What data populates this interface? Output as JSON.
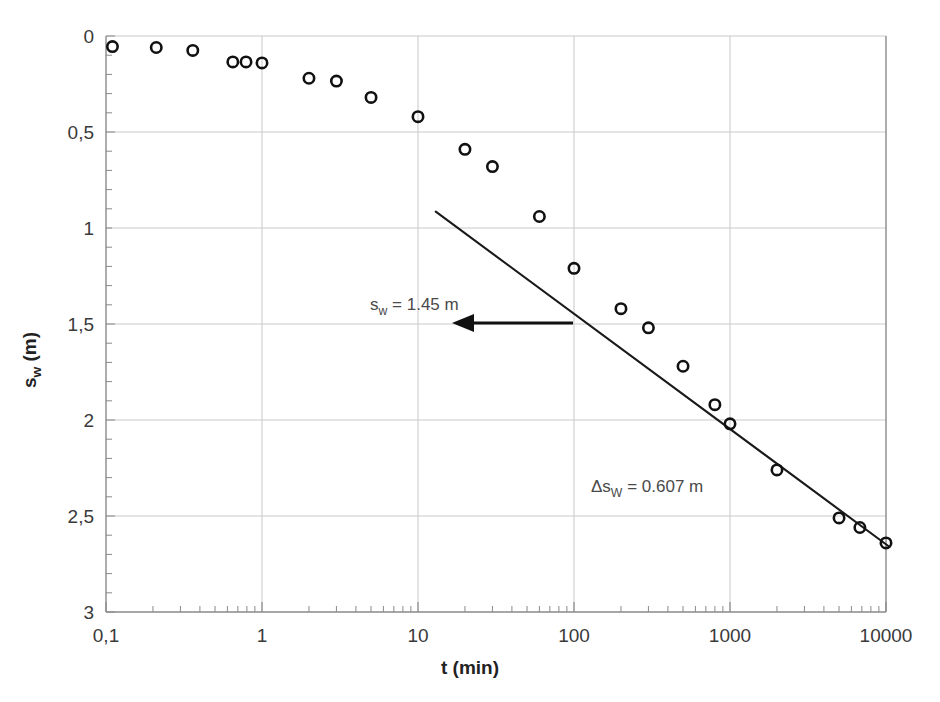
{
  "chart_data": {
    "type": "scatter",
    "title": "",
    "xlabel": "t (min)",
    "ylabel": "s_w (m)",
    "ylabel_base": "s",
    "ylabel_sub": "w",
    "ylabel_unit": " (m)",
    "xscale": "log",
    "yscale": "linear",
    "xlim": [
      0.1,
      10000
    ],
    "ylim": [
      0,
      3
    ],
    "y_inverted": true,
    "grid": true,
    "legend": "none",
    "x_tick_labels": [
      "0,1",
      "1",
      "10",
      "100",
      "1000",
      "10000"
    ],
    "x_tick_values": [
      0.1,
      1,
      10,
      100,
      1000,
      10000
    ],
    "y_tick_labels": [
      "0",
      "0,5",
      "1",
      "1,5",
      "2",
      "2,5",
      "3"
    ],
    "y_tick_values": [
      0,
      0.5,
      1,
      1.5,
      2,
      2.5,
      3
    ],
    "series": [
      {
        "name": "drawdown-observations",
        "marker": "open-circle",
        "points": [
          {
            "t": 0.11,
            "s": 0.055
          },
          {
            "t": 0.21,
            "s": 0.06
          },
          {
            "t": 0.36,
            "s": 0.075
          },
          {
            "t": 0.65,
            "s": 0.135
          },
          {
            "t": 0.79,
            "s": 0.135
          },
          {
            "t": 1.0,
            "s": 0.14
          },
          {
            "t": 2.0,
            "s": 0.22
          },
          {
            "t": 3.0,
            "s": 0.235
          },
          {
            "t": 5.0,
            "s": 0.32
          },
          {
            "t": 10.0,
            "s": 0.42
          },
          {
            "t": 20.0,
            "s": 0.59
          },
          {
            "t": 30.0,
            "s": 0.68
          },
          {
            "t": 60.0,
            "s": 0.94
          },
          {
            "t": 100.0,
            "s": 1.21
          },
          {
            "t": 200.0,
            "s": 1.42
          },
          {
            "t": 300.0,
            "s": 1.52
          },
          {
            "t": 500.0,
            "s": 1.72
          },
          {
            "t": 800.0,
            "s": 1.92
          },
          {
            "t": 1000.0,
            "s": 2.02
          },
          {
            "t": 2000.0,
            "s": 2.26
          },
          {
            "t": 5000.0,
            "s": 2.51
          },
          {
            "t": 6800.0,
            "s": 2.56
          },
          {
            "t": 10000.0,
            "s": 2.64
          }
        ]
      }
    ],
    "fit_line": {
      "name": "straight-line-fit",
      "p1": {
        "t": 13.0,
        "s": 0.915
      },
      "p2": {
        "t": 10500.0,
        "s": 2.66
      },
      "slope_per_log_cycle": 0.607
    },
    "annotations": [
      {
        "name": "sw-value-label",
        "text_base": "s",
        "text_sub": "w",
        "text_rest": " = 1.45 m",
        "full_text": "s_w = 1.45 m",
        "x": 370,
        "y": 310
      },
      {
        "name": "delta-sw-label",
        "text_base": "Δs",
        "text_sub": "W",
        "text_rest": " = 0.607 m",
        "full_text": "Δs_W = 0.607 m",
        "x": 591,
        "y": 492
      }
    ],
    "arrow": {
      "name": "sw-pointer-arrow",
      "from_x": 573,
      "to_x": 452,
      "y": 323
    },
    "colors": {
      "marker_stroke": "#111111",
      "line": "#1a1a1a",
      "grid": "#c9c9c9",
      "axis": "#8a8a8a",
      "text": "#3a3a3a",
      "background": "#ffffff"
    }
  }
}
